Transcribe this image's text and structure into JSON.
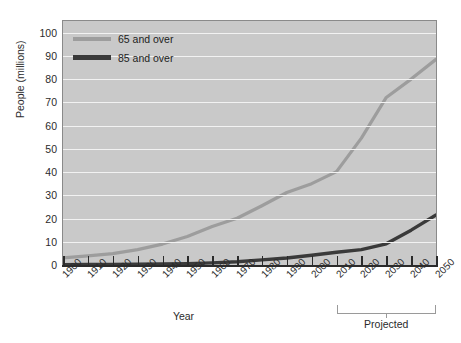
{
  "chart_data": {
    "type": "line",
    "title": "",
    "xlabel": "Year",
    "ylabel": "People (millions)",
    "xlim": [
      1900,
      2050
    ],
    "ylim": [
      0,
      105
    ],
    "yticks": [
      0,
      10,
      20,
      30,
      40,
      50,
      60,
      70,
      80,
      90,
      100
    ],
    "xticks": [
      1900,
      1910,
      1920,
      1930,
      1940,
      1950,
      1960,
      1970,
      1980,
      1990,
      2000,
      2010,
      2020,
      2030,
      2040,
      2050
    ],
    "grid": true,
    "legend_position": "top-left",
    "annotations": [
      {
        "text": "Projected",
        "x_start": 2010,
        "x_end": 2050
      }
    ],
    "x": [
      1900,
      1910,
      1920,
      1930,
      1940,
      1950,
      1960,
      1970,
      1980,
      1990,
      2000,
      2010,
      2020,
      2030,
      2040,
      2050
    ],
    "series": [
      {
        "name": "65 and over",
        "color": "#9d9d9d",
        "values": [
          3.1,
          3.9,
          4.9,
          6.6,
          9.0,
          12.3,
          16.6,
          20.1,
          25.5,
          31.2,
          35.0,
          40.2,
          54.6,
          72.1,
          80.0,
          88.5
        ]
      },
      {
        "name": "85 and over",
        "color": "#3a3a3a",
        "values": [
          0.1,
          0.2,
          0.2,
          0.3,
          0.4,
          0.6,
          0.9,
          1.4,
          2.2,
          3.0,
          4.2,
          5.5,
          6.6,
          9.1,
          15.0,
          21.5
        ]
      }
    ]
  },
  "axis": {
    "ylabel": "People (millions)",
    "xlabel": "Year",
    "ytick_labels": [
      "100",
      "90",
      "80",
      "70",
      "60",
      "50",
      "40",
      "30",
      "20",
      "10",
      "0"
    ],
    "xtick_labels": [
      "1900",
      "1910",
      "1920",
      "1930",
      "1940",
      "1950",
      "1960",
      "1970",
      "1980",
      "1990",
      "2000",
      "2010",
      "2020",
      "2030",
      "2040",
      "2050"
    ]
  },
  "legend": {
    "items": [
      {
        "label": "65 and over",
        "color": "#9d9d9d"
      },
      {
        "label": "85 and over",
        "color": "#3a3a3a"
      }
    ]
  },
  "projected": {
    "label": "Projected"
  },
  "colors": {
    "plot_background": "#c9c9c9",
    "gridline": "#f2f2f2",
    "axis": "#2b2b2b",
    "series_65": "#9d9d9d",
    "series_85": "#3a3a3a",
    "bracket": "#9a9a9a"
  }
}
